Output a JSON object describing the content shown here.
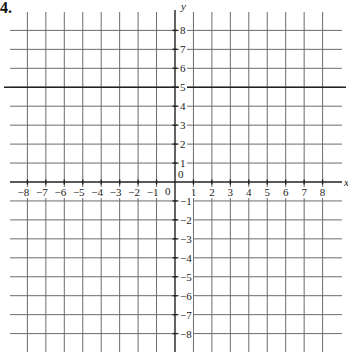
{
  "question_number": "4.",
  "chart_data": {
    "type": "line",
    "title": "",
    "xlabel": "x",
    "ylabel": "y",
    "xlim": [
      -8.8,
      8.8
    ],
    "ylim": [
      -8.8,
      8.8
    ],
    "grid": true,
    "x_ticks": [
      -8,
      -7,
      -6,
      -5,
      -4,
      -3,
      -2,
      -1,
      1,
      2,
      3,
      4,
      5,
      6,
      7,
      8
    ],
    "y_ticks": [
      -8,
      -7,
      -6,
      -5,
      -4,
      -3,
      -2,
      -1,
      1,
      2,
      3,
      4,
      5,
      6,
      7,
      8
    ],
    "origin_label": "0",
    "series": [
      {
        "name": "y = 5",
        "equation": "y = 5",
        "x": [
          -8.8,
          8.8
        ],
        "values": [
          5,
          5
        ]
      }
    ]
  },
  "colors": {
    "grid": "#6b6b6b",
    "axis": "#222222",
    "line": "#222222"
  }
}
